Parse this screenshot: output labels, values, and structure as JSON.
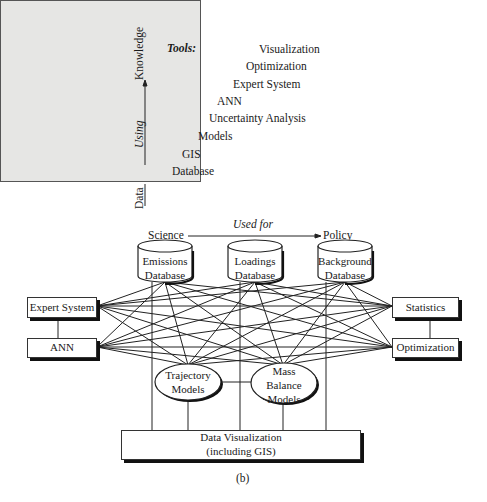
{
  "panel_a": {
    "tools_label": "Tools:",
    "tools": [
      "Visualization",
      "Optimization",
      "Expert System",
      "ANN",
      "Uncertainty Analysis",
      "Models",
      "GIS",
      "Database"
    ],
    "y_axis": {
      "from": "Data",
      "to": "Knowledge",
      "label": "Using"
    },
    "x_axis": {
      "from": "Science",
      "to": "Policy",
      "label": "Used for"
    },
    "caption": "(a)"
  },
  "panel_b": {
    "databases": [
      {
        "line1": "Emissions",
        "line2": "Database"
      },
      {
        "line1": "Loadings",
        "line2": "Database"
      },
      {
        "line1": "Background",
        "line2": "Database"
      }
    ],
    "left_boxes": [
      "Expert System",
      "ANN"
    ],
    "right_boxes": [
      "Statistics",
      "Optimization"
    ],
    "models": [
      {
        "line1": "Trajectory",
        "line2": "Models",
        "line3": ""
      },
      {
        "line1": "Mass",
        "line2": "Balance",
        "line3": "Models"
      }
    ],
    "visualization": {
      "line1": "Data Visualization",
      "line2": "(including GIS)"
    },
    "caption": "(b)"
  }
}
